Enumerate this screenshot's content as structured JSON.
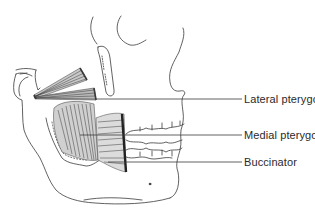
{
  "figure": {
    "labels": [
      {
        "id": "lateral-pterygoid",
        "text": "Lateral pterygoid",
        "x": 244,
        "y": 93
      },
      {
        "id": "medial-pterygoid",
        "text": "Medial pterygoid",
        "x": 244,
        "y": 128
      },
      {
        "id": "buccinator",
        "text": "Buccinator",
        "x": 244,
        "y": 155
      }
    ],
    "colors": {
      "line": "#3a3a3a",
      "muscle_fill": "#6a6a6a",
      "background": "#ffffff",
      "text": "#2a2a2a"
    }
  }
}
